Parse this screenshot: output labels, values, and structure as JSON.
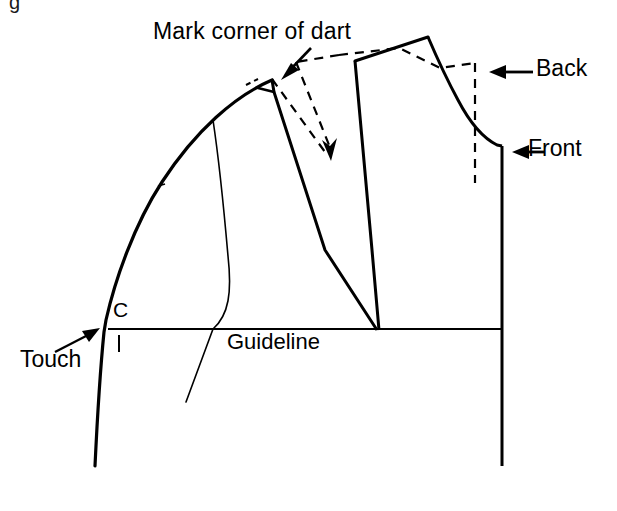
{
  "figure": {
    "kind": "pattern-drafting-diagram",
    "background_color": "#ffffff",
    "ink_color": "#000000"
  },
  "labels": {
    "mark_corner_of_dart": "Mark corner of dart",
    "back": "Back",
    "front": "Front",
    "touch": "Touch",
    "guideline": "Guideline",
    "point_c": "C",
    "cropped_caption_fragment": "g"
  },
  "annotations": [
    {
      "name": "mark-corner-of-dart",
      "text": "Mark corner of dart",
      "has_leader_arrow": true,
      "arrow_direction": "down-left",
      "points_to": "dart corner at top of front shoulder"
    },
    {
      "name": "back",
      "text": "Back",
      "has_leader_arrow": true,
      "arrow_direction": "left",
      "points_to": "back pattern piece dashed outline"
    },
    {
      "name": "front",
      "text": "Front",
      "has_leader_arrow": true,
      "arrow_direction": "left",
      "points_to": "front pattern piece side seam"
    },
    {
      "name": "touch",
      "text": "Touch",
      "has_leader_arrow": true,
      "arrow_direction": "up-right",
      "points_to": "point C where curve touches guideline"
    },
    {
      "name": "guideline",
      "text": "Guideline",
      "has_leader_arrow": false,
      "points_to": "horizontal baseline"
    },
    {
      "name": "point-c",
      "text": "C",
      "has_leader_arrow": false,
      "points_to": "intersection of curved edge and guideline"
    }
  ],
  "line_styles": {
    "solid_heavy": {
      "width": 3.0,
      "dash": "none"
    },
    "solid_light": {
      "width": 1.6,
      "dash": "none"
    },
    "dashed": {
      "width": 2.2,
      "dash": "9 7"
    }
  },
  "geometry": {
    "guideline": {
      "x1": 108,
      "y1": 329,
      "x2": 502,
      "y2": 329
    },
    "right_vertical": {
      "x1": 502,
      "y1": 146,
      "x2": 502,
      "y2": 466
    },
    "dashed_vertical": {
      "x1": 475,
      "y1": 63,
      "x2": 475,
      "y2": 183
    },
    "dart_apex": {
      "x": 378,
      "y": 330
    },
    "shoulder_peak": {
      "x": 428,
      "y": 37
    },
    "touch_point": {
      "x": 110,
      "y": 329
    }
  }
}
